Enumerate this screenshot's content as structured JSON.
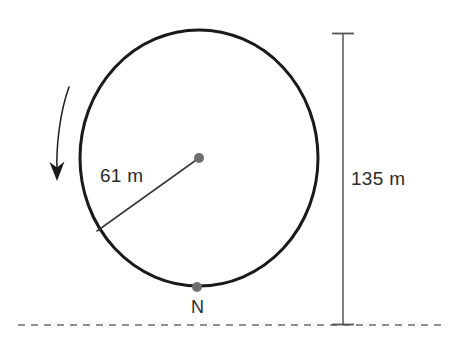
{
  "figure": {
    "type": "geometry-diagram",
    "background_color": "#ffffff"
  },
  "colors": {
    "wheel_stroke": "#1a1a1a",
    "radius_stroke": "#3a3a3a",
    "point_fill": "#6e6e6e",
    "text": "#2b2b2b",
    "dimension_stroke": "#555555",
    "ground_stroke": "#6b6b6b",
    "arrow_stroke": "#1a1a1a"
  },
  "wheel": {
    "name": "ferris-wheel-circle",
    "center_x": 199,
    "center_y": 158,
    "radius_x": 119,
    "radius_y": 128,
    "stroke_width": 3
  },
  "center_point": {
    "name": "hub",
    "x": 199,
    "y": 158,
    "dot_radius": 5
  },
  "radius": {
    "label": "61 m",
    "value": 61,
    "unit": "m",
    "from_x": 199,
    "from_y": 158,
    "to_x": 97,
    "to_y": 231,
    "label_x": 100,
    "label_y": 182
  },
  "boarding_point": {
    "name": "N",
    "label": "N",
    "x": 197,
    "y": 287,
    "dot_radius": 5,
    "label_x": 191,
    "label_y": 313
  },
  "height_dimension": {
    "label": "135 m",
    "value": 135,
    "unit": "m",
    "line_x": 343,
    "top_y": 33,
    "bottom_y": 325,
    "tick_half_width": 11,
    "label_x": 351,
    "label_y": 185
  },
  "ground_line": {
    "name": "ground",
    "y": 325,
    "x_start": 18,
    "x_end": 447,
    "dash": "7 6"
  },
  "rotation_arrow": {
    "name": "rotation-direction-arrow",
    "direction": "counterclockwise-downward",
    "path": "M 69 87 C 60 112, 56 145, 57 172",
    "head_points": "57,180 50,163 57,168 64,162"
  }
}
